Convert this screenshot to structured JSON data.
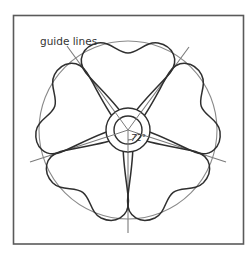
{
  "diagram": {
    "title": "",
    "labels": {
      "guide_lines": "guide lines",
      "angle": "72°"
    },
    "geometry": {
      "frame": {
        "x": 13,
        "y": 15,
        "width": 230,
        "height": 229
      },
      "center": {
        "x": 128,
        "y": 130
      },
      "outer_circle_radius": 89,
      "inner_ring_outer_radius": 22,
      "inner_ring_inner_radius": 14,
      "guide_line_count": 5,
      "angle_between_lines_deg": 72,
      "petal_count": 5
    },
    "colors": {
      "frame": "#555555",
      "petal_outline": "#333333",
      "guide_line": "#777777",
      "outer_circle": "#888888",
      "text": "#333333"
    }
  }
}
